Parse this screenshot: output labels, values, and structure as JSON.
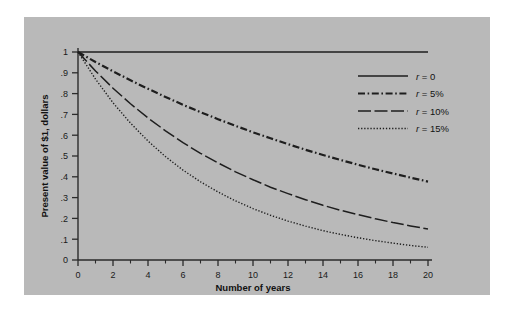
{
  "figure": {
    "panel_color": "#b9b9b9",
    "background_color": "#ffffff",
    "axis_color": "#2b2b2b",
    "curve_color": "#1e1e1e"
  },
  "chart_data": {
    "type": "line",
    "title": "",
    "xlabel": "Number of years",
    "ylabel": "Present value of $1, dollars",
    "xlim": [
      0,
      20
    ],
    "ylim": [
      0,
      1
    ],
    "grid": false,
    "legend_position": "upper right",
    "x_major_ticks": [
      0,
      2,
      4,
      6,
      8,
      10,
      12,
      14,
      16,
      18,
      20
    ],
    "x_major_tick_labels": [
      "0",
      "2",
      "4",
      "6",
      "8",
      "10",
      "12",
      "14",
      "16",
      "18",
      "20"
    ],
    "x_minor_ticks": [
      1,
      3,
      5,
      7,
      9,
      11,
      13,
      15,
      17,
      19
    ],
    "y_major_ticks": [
      0,
      0.1,
      0.2,
      0.3,
      0.4,
      0.5,
      0.6,
      0.7,
      0.8,
      0.9,
      1
    ],
    "y_major_tick_labels": [
      "0",
      ".1",
      ".2",
      ".3",
      ".4",
      ".5",
      ".6",
      ".7",
      ".8",
      ".9",
      "1"
    ],
    "x": [
      0,
      1,
      2,
      3,
      4,
      5,
      6,
      7,
      8,
      9,
      10,
      11,
      12,
      13,
      14,
      15,
      16,
      17,
      18,
      19,
      20
    ],
    "series": [
      {
        "name": "r = 0",
        "rate": 0,
        "style": "solid",
        "values": [
          1,
          1,
          1,
          1,
          1,
          1,
          1,
          1,
          1,
          1,
          1,
          1,
          1,
          1,
          1,
          1,
          1,
          1,
          1,
          1,
          1
        ]
      },
      {
        "name": "r = 5%",
        "rate": 0.05,
        "style": "dash-dot",
        "values": [
          1,
          0.952,
          0.907,
          0.864,
          0.823,
          0.784,
          0.746,
          0.711,
          0.677,
          0.645,
          0.614,
          0.585,
          0.557,
          0.53,
          0.505,
          0.481,
          0.458,
          0.436,
          0.416,
          0.396,
          0.377
        ]
      },
      {
        "name": "r = 10%",
        "rate": 0.1,
        "style": "long-dash",
        "values": [
          1,
          0.909,
          0.826,
          0.751,
          0.683,
          0.621,
          0.564,
          0.513,
          0.467,
          0.424,
          0.386,
          0.35,
          0.319,
          0.29,
          0.263,
          0.239,
          0.218,
          0.198,
          0.18,
          0.164,
          0.149
        ]
      },
      {
        "name": "r = 15%",
        "rate": 0.15,
        "style": "dotted",
        "values": [
          1,
          0.87,
          0.756,
          0.658,
          0.572,
          0.497,
          0.432,
          0.376,
          0.327,
          0.284,
          0.247,
          0.215,
          0.187,
          0.163,
          0.141,
          0.123,
          0.107,
          0.093,
          0.081,
          0.07,
          0.061
        ]
      }
    ],
    "legend": [
      {
        "label_prefix": "r",
        "label_rest": " = 0",
        "style": "solid"
      },
      {
        "label_prefix": "r",
        "label_rest": " = 5%",
        "style": "dash-dot"
      },
      {
        "label_prefix": "r",
        "label_rest": " = 10%",
        "style": "long-dash"
      },
      {
        "label_prefix": "r",
        "label_rest": " = 15%",
        "style": "dotted"
      }
    ]
  }
}
